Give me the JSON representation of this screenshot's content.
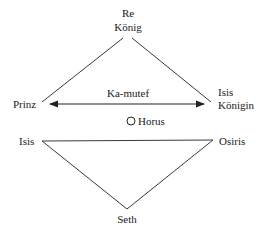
{
  "diagram": {
    "top_triangle": {
      "apex": {
        "line1": "Re",
        "line2": "König"
      },
      "left": "Prinz",
      "right": {
        "line1": "Isis",
        "line2": "Königin"
      },
      "arrow_label": "Ka-mutef"
    },
    "center": {
      "label": "Horus",
      "marker": "circle-icon"
    },
    "bottom_triangle": {
      "left": "Isis",
      "right": "Osiris",
      "bottom": "Seth"
    },
    "colors": {
      "line": "#3a3a3a",
      "text": "#1a1a1a"
    }
  }
}
